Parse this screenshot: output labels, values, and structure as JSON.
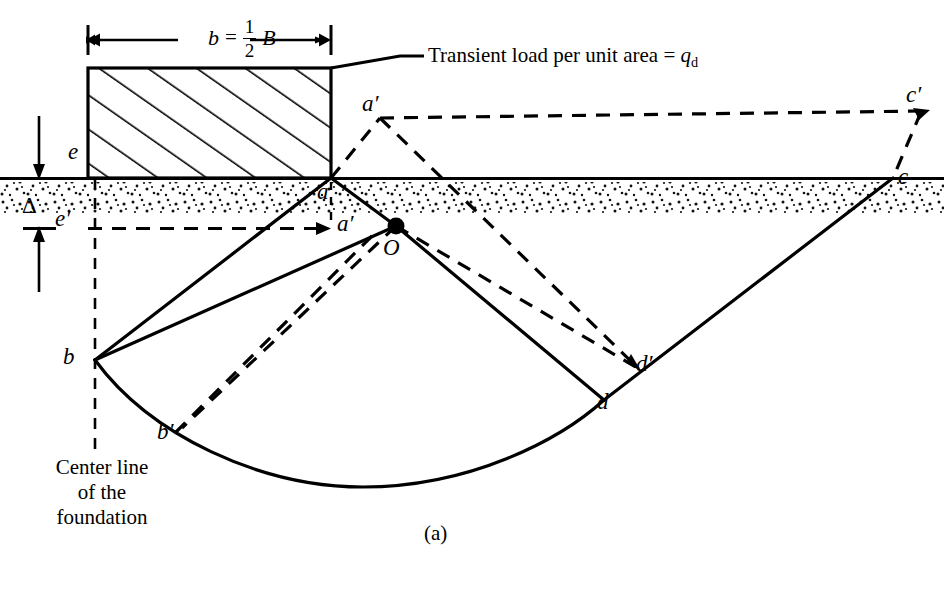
{
  "figure": {
    "caption": "(a)",
    "dimension": {
      "symbol_b": "b",
      "equals": "=",
      "numerator": "1",
      "denominator": "2",
      "symbol_B": "B"
    },
    "load_annotation": {
      "text_before": "Transient load per unit area  =  ",
      "symbol": "q",
      "subscript": "d"
    },
    "settlement_symbol": "Δ",
    "center_line_note": {
      "line1": "Center line",
      "line2": "of the",
      "line3": "foundation"
    },
    "points": [
      {
        "id": "e",
        "label": "e",
        "x": 68,
        "y": 152
      },
      {
        "id": "e-prime",
        "label": "e′",
        "x": 58,
        "y": 219
      },
      {
        "id": "a",
        "label": "a",
        "x": 318,
        "y": 183
      },
      {
        "id": "a-prime-upper",
        "label": "a′",
        "x": 364,
        "y": 104
      },
      {
        "id": "a-prime-lower",
        "label": "a′",
        "x": 338,
        "y": 218
      },
      {
        "id": "O",
        "label": "O",
        "x": 385,
        "y": 240
      },
      {
        "id": "b",
        "label": "b",
        "x": 64,
        "y": 348
      },
      {
        "id": "b-prime",
        "label": "b′",
        "x": 158,
        "y": 423
      },
      {
        "id": "c",
        "label": "c",
        "x": 900,
        "y": 168
      },
      {
        "id": "c-prime",
        "label": "c′",
        "x": 908,
        "y": 95
      },
      {
        "id": "d",
        "label": "d",
        "x": 598,
        "y": 392
      },
      {
        "id": "d-prime",
        "label": "d′",
        "x": 637,
        "y": 355
      }
    ],
    "colors": {
      "ink": "#000000",
      "paper": "#ffffff",
      "soil_stipple": "#1a1a1a"
    }
  },
  "geometry": {
    "foundation_rect": {
      "x": 88,
      "y": 68,
      "width": 243,
      "height": 110
    },
    "ground_line_y": 178,
    "soil_band": {
      "top": 182,
      "bottom": 213
    },
    "dimension_line_y": 40,
    "point_coords": {
      "a": {
        "x": 331,
        "y": 178
      },
      "a_up": {
        "x": 380,
        "y": 118
      },
      "a_low": {
        "x": 331,
        "y": 228
      },
      "O": {
        "x": 396,
        "y": 226
      },
      "b": {
        "x": 95,
        "y": 360
      },
      "b_prime": {
        "x": 182,
        "y": 428
      },
      "c": {
        "x": 893,
        "y": 178
      },
      "c_prime": {
        "x": 930,
        "y": 110
      },
      "d": {
        "x": 604,
        "y": 400
      },
      "d_prime": {
        "x": 639,
        "y": 369
      },
      "e": {
        "x": 88,
        "y": 178
      },
      "e_prime": {
        "x": 88,
        "y": 228
      }
    }
  }
}
